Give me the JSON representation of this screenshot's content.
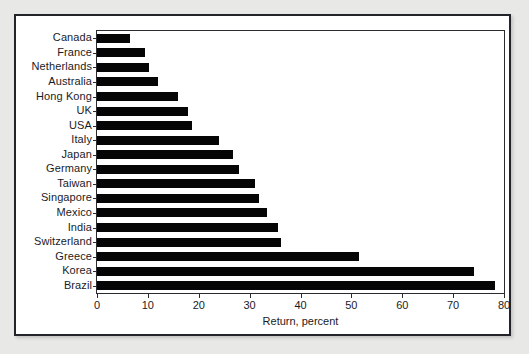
{
  "figure": {
    "frame_color": "#23242a",
    "page_background": "#e8e8e6",
    "plot_background": "#ffffff",
    "bar_color": "#050505"
  },
  "chart_data": {
    "type": "bar",
    "orientation": "horizontal",
    "title": "",
    "subtitle": "",
    "xlabel": "Return, percent",
    "ylabel": "",
    "xlim": [
      0,
      80
    ],
    "ylim": null,
    "xticks": [
      0,
      10,
      20,
      30,
      40,
      50,
      60,
      70,
      80
    ],
    "xticklabels": [
      "0",
      "10",
      "20",
      "30",
      "40",
      "50",
      "60",
      "70",
      "80"
    ],
    "grid": false,
    "legend": null,
    "annotations": [],
    "categories": [
      "Canada",
      "France",
      "Netherlands",
      "Australia",
      "Hong Kong",
      "UK",
      "USA",
      "Italy",
      "Japan",
      "Germany",
      "Taiwan",
      "Singapore",
      "Mexico",
      "India",
      "Switzerland",
      "Greece",
      "Korea",
      "Brazil"
    ],
    "values": [
      6.5,
      9.5,
      10.3,
      12.0,
      16.0,
      17.8,
      18.6,
      24.0,
      26.8,
      28.0,
      31.0,
      31.8,
      33.5,
      35.5,
      36.2,
      51.5,
      74.2,
      78.2
    ],
    "values_unit": "percent",
    "series": [
      {
        "name": "Return, percent",
        "values": [
          6.5,
          9.5,
          10.3,
          12.0,
          16.0,
          17.8,
          18.6,
          24.0,
          26.8,
          28.0,
          31.0,
          31.8,
          33.5,
          35.5,
          36.2,
          51.5,
          74.2,
          78.2
        ]
      }
    ]
  }
}
